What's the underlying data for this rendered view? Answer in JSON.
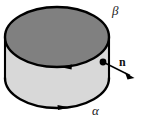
{
  "figure": {
    "type": "geometry-diagram",
    "background_color": "#ffffff",
    "width": 147,
    "height": 122
  },
  "labels": {
    "top_boundary": "β",
    "bottom_boundary": "α",
    "normal_vector": "n"
  },
  "shape": {
    "name": "cylinder",
    "top_face": {
      "name": "top-ellipse",
      "fill": "#808080",
      "stroke": "#000000",
      "center_x": 57,
      "center_y": 37,
      "radius_x": 52,
      "radius_y": 30
    },
    "side_face": {
      "name": "cylinder-side",
      "fill": "#d8d8d8",
      "stroke": "#000000"
    },
    "bottom_face": {
      "name": "bottom-ellipse-front-arc",
      "fill": "#d8d8d8",
      "stroke": "#000000",
      "center_x": 57,
      "center_y": 78,
      "radius_x": 52,
      "radius_y": 30
    }
  },
  "orientation": {
    "top_curve_arrow_direction": "left",
    "bottom_curve_arrow_direction": "right"
  },
  "normal": {
    "base_point_x": 103,
    "base_point_y": 62,
    "tip_x": 133,
    "tip_y": 77,
    "dot_radius": 3.4,
    "color": "#000000"
  },
  "colors": {
    "outline": "#000000",
    "top_fill": "#808080",
    "side_fill": "#d8d8d8",
    "background": "#ffffff",
    "label_text": "#1a1a1a"
  }
}
